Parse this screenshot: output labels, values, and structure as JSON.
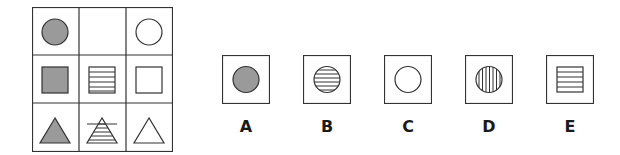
{
  "puzzle": {
    "colors": {
      "gray_fill": "#9a9a9a",
      "stroke": "#333333",
      "background": "#ffffff"
    },
    "grid": {
      "rows": 3,
      "cols": 3,
      "cells": [
        {
          "row": 0,
          "col": 0,
          "shape": "circle",
          "fill": "gray"
        },
        {
          "row": 0,
          "col": 1,
          "shape": "empty",
          "fill": "none"
        },
        {
          "row": 0,
          "col": 2,
          "shape": "circle",
          "fill": "white"
        },
        {
          "row": 1,
          "col": 0,
          "shape": "square",
          "fill": "gray"
        },
        {
          "row": 1,
          "col": 1,
          "shape": "square",
          "fill": "horizontal-stripes"
        },
        {
          "row": 1,
          "col": 2,
          "shape": "square",
          "fill": "white"
        },
        {
          "row": 2,
          "col": 0,
          "shape": "triangle",
          "fill": "gray"
        },
        {
          "row": 2,
          "col": 1,
          "shape": "triangle",
          "fill": "horizontal-stripes"
        },
        {
          "row": 2,
          "col": 2,
          "shape": "triangle",
          "fill": "white"
        }
      ]
    },
    "options": [
      {
        "label": "A",
        "shape": "circle",
        "fill": "gray"
      },
      {
        "label": "B",
        "shape": "circle",
        "fill": "horizontal-stripes"
      },
      {
        "label": "C",
        "shape": "circle",
        "fill": "white"
      },
      {
        "label": "D",
        "shape": "circle",
        "fill": "vertical-stripes"
      },
      {
        "label": "E",
        "shape": "square",
        "fill": "horizontal-stripes"
      }
    ]
  }
}
